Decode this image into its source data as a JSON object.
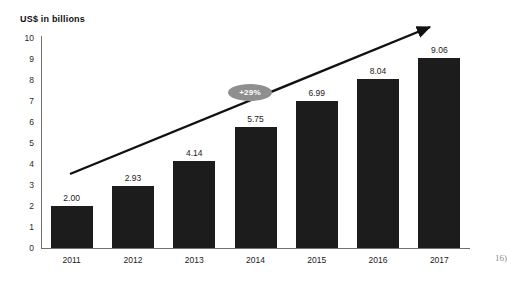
{
  "chart_data": {
    "type": "bar",
    "title": "US$ in billions",
    "xlabel": "",
    "ylabel": "US$ in billions",
    "categories": [
      "2011",
      "2012",
      "2013",
      "2014",
      "2015",
      "2016",
      "2017"
    ],
    "values": [
      2.0,
      2.93,
      4.14,
      5.75,
      6.99,
      8.04,
      9.06
    ],
    "value_labels": [
      "2.00",
      "2.93",
      "4.14",
      "5.75",
      "6.99",
      "8.04",
      "9.06"
    ],
    "ylim": [
      0,
      10
    ],
    "y_ticks": [
      "10",
      "9",
      "8",
      "7",
      "6",
      "5",
      "4",
      "3",
      "2",
      "1",
      "0"
    ],
    "y_tick_values": [
      10,
      9,
      8,
      7,
      6,
      5,
      4,
      3,
      2,
      1,
      0
    ],
    "grid": false,
    "legend": null,
    "bar_color": "#1c1c1c",
    "annotations": {
      "trend_arrow": {
        "label": "",
        "direction": "up-right",
        "color": "#111111"
      },
      "growth_badge": {
        "label": "+29%",
        "background": "#8f8f8f",
        "text_color": "#ffffff"
      }
    }
  },
  "footnote": {
    "text": "16)"
  }
}
